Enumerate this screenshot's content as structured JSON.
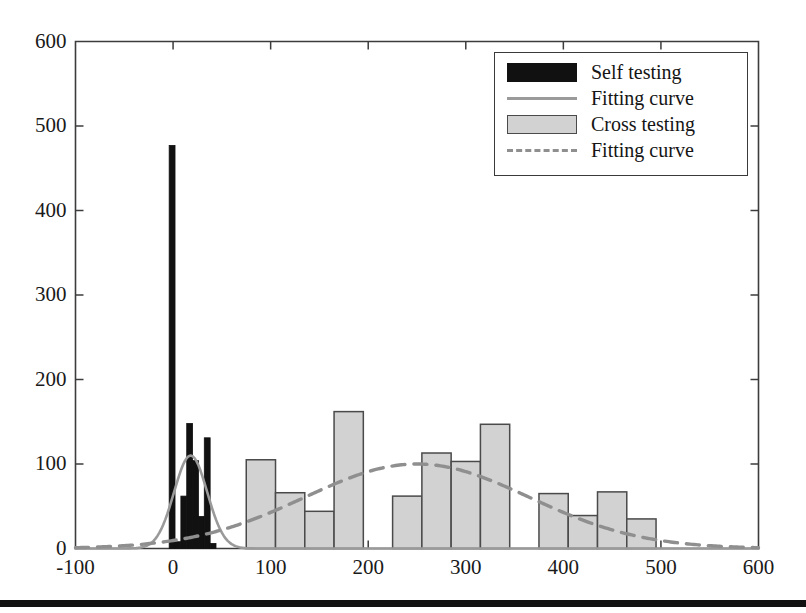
{
  "chart_data": {
    "type": "bar",
    "title": "",
    "xlabel": "",
    "ylabel": "",
    "xlim": [
      -100,
      600
    ],
    "ylim": [
      0,
      600
    ],
    "xticks": [
      -100,
      0,
      100,
      200,
      300,
      400,
      500,
      600
    ],
    "yticks": [
      0,
      100,
      200,
      300,
      400,
      500,
      600
    ],
    "xtick_labels": [
      "-100",
      "0",
      "100",
      "200",
      "300",
      "400",
      "500",
      "600"
    ],
    "ytick_labels": [
      "0",
      "100",
      "200",
      "300",
      "400",
      "500",
      "600"
    ],
    "grid": false,
    "legend_position": "upper right",
    "series": [
      {
        "name": "Self testing",
        "type": "bar",
        "color": "#111111",
        "edge_color": "#111111",
        "bin_width": 6,
        "bins": [
          {
            "x0": -4,
            "x1": 2,
            "value": 477
          },
          {
            "x0": 2,
            "x1": 8,
            "value": 8
          },
          {
            "x0": 8,
            "x1": 14,
            "value": 62
          },
          {
            "x0": 14,
            "x1": 20,
            "value": 148
          },
          {
            "x0": 20,
            "x1": 26,
            "value": 104
          },
          {
            "x0": 26,
            "x1": 32,
            "value": 38
          },
          {
            "x0": 32,
            "x1": 38,
            "value": 131
          },
          {
            "x0": 38,
            "x1": 44,
            "value": 6
          }
        ]
      },
      {
        "name": "Fitting curve",
        "type": "line",
        "style": "solid",
        "color": "#9a9a9a",
        "fit": {
          "peak_x": 18,
          "peak_y": 110,
          "sigma": 17
        }
      },
      {
        "name": "Cross testing",
        "type": "bar",
        "color": "#d2d2d2",
        "edge_color": "#4a4a4a",
        "bin_width": 30,
        "bins": [
          {
            "x0": 75,
            "x1": 105,
            "value": 105
          },
          {
            "x0": 105,
            "x1": 135,
            "value": 66
          },
          {
            "x0": 135,
            "x1": 165,
            "value": 44
          },
          {
            "x0": 165,
            "x1": 195,
            "value": 162
          },
          {
            "x0": 195,
            "x1": 225,
            "value": 0
          },
          {
            "x0": 225,
            "x1": 255,
            "value": 62
          },
          {
            "x0": 255,
            "x1": 285,
            "value": 113
          },
          {
            "x0": 285,
            "x1": 315,
            "value": 103
          },
          {
            "x0": 315,
            "x1": 345,
            "value": 147
          },
          {
            "x0": 345,
            "x1": 375,
            "value": 0
          },
          {
            "x0": 375,
            "x1": 405,
            "value": 65
          },
          {
            "x0": 405,
            "x1": 435,
            "value": 39
          },
          {
            "x0": 435,
            "x1": 465,
            "value": 67
          },
          {
            "x0": 465,
            "x1": 495,
            "value": 35
          }
        ]
      },
      {
        "name": "Fitting curve",
        "type": "line",
        "style": "dashed",
        "color": "#8f8f8f",
        "fit": {
          "peak_x": 250,
          "peak_y": 100,
          "sigma": 115
        }
      }
    ]
  },
  "legend": {
    "items": [
      {
        "label": "Self testing",
        "key": "black-swatch"
      },
      {
        "label": "Fitting curve",
        "key": "solid-line"
      },
      {
        "label": "Cross testing",
        "key": "gray-swatch"
      },
      {
        "label": "Fitting curve",
        "key": "dashed-line"
      }
    ]
  },
  "axes": {
    "y_labels": [
      "600",
      "500",
      "400",
      "300",
      "200",
      "100",
      "0"
    ],
    "x_labels": [
      "-100",
      "0",
      "100",
      "200",
      "300",
      "400",
      "500",
      "600"
    ]
  }
}
